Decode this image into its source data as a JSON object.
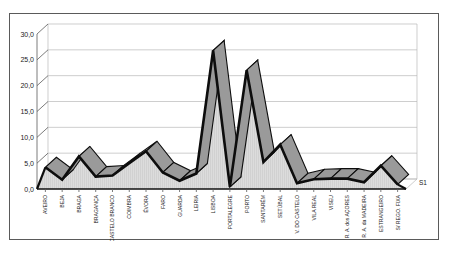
{
  "chart": {
    "series_label": "S1",
    "yaxis": {
      "ticks": [
        "0,0",
        "5,0",
        "10,0",
        "15,0",
        "20,0",
        "25,0",
        "30,0"
      ]
    }
  },
  "chart_data": {
    "type": "area",
    "title": "",
    "xlabel": "",
    "ylabel": "",
    "ylim": [
      0,
      30
    ],
    "yticks": [
      0,
      5,
      10,
      15,
      20,
      25,
      30
    ],
    "ytick_labels": [
      "0,0",
      "5,0",
      "10,0",
      "15,0",
      "20,0",
      "25,0",
      "30,0"
    ],
    "grid": true,
    "legend": [
      "S1"
    ],
    "legend_position": "right",
    "categories": [
      "AVEIRO",
      "BEJA",
      "BRAGA",
      "BRAGANÇA",
      "CASTELO BRANCO",
      "COIMBRA",
      "ÉVORA",
      "FARO",
      "GUARDA",
      "LEIRIA",
      "LISBOA",
      "PORTALEGRE",
      "PORTO",
      "SANTARÉM",
      "SETÚBAL",
      "V. DO CASTELO",
      "VILA REAL",
      "VISEU",
      "R. A. dos AÇORES",
      "R. A. da MADEIRA",
      "ESTRANGEIRO",
      "S/ REGO. FIXA"
    ],
    "series": [
      {
        "name": "S1",
        "values": [
          4.2,
          1.8,
          6.3,
          2.4,
          2.6,
          5.0,
          7.3,
          3.2,
          1.6,
          3.0,
          26.8,
          0.4,
          23.0,
          5.2,
          8.6,
          1.1,
          1.9,
          2.0,
          2.0,
          1.3,
          4.5,
          0.9
        ]
      }
    ]
  }
}
